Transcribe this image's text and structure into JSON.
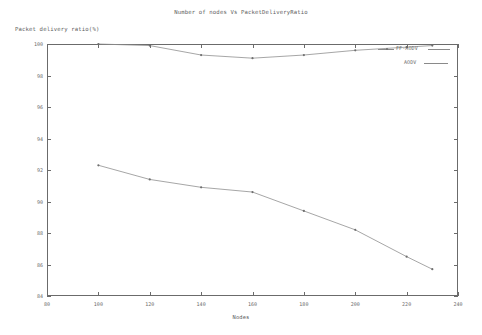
{
  "chart_data": {
    "type": "line",
    "title": "Number of nodes Vs PacketDeliveryRatio",
    "xlabel": "Nodes",
    "ylabel": "Packet delivery ratio(%)",
    "xlim": [
      80,
      240
    ],
    "ylim": [
      84,
      100
    ],
    "xticks": [
      80,
      100,
      120,
      140,
      160,
      180,
      200,
      220,
      240
    ],
    "yticks": [
      84,
      86,
      88,
      90,
      92,
      94,
      96,
      98,
      100
    ],
    "grid": false,
    "legend_position": "upper-right-inside",
    "series": [
      {
        "name": "FF-AODV",
        "x": [
          100,
          120,
          140,
          160,
          180,
          200,
          220,
          230
        ],
        "values": [
          100.0,
          99.9,
          99.3,
          99.1,
          99.3,
          99.6,
          99.8,
          99.9
        ]
      },
      {
        "name": "AODV",
        "x": [
          100,
          120,
          140,
          160,
          180,
          200,
          220,
          230
        ],
        "values": [
          92.3,
          91.4,
          90.9,
          90.6,
          89.4,
          88.2,
          86.5,
          85.7
        ]
      }
    ]
  },
  "legend": {
    "items": [
      {
        "label": "FF-AODV"
      },
      {
        "label": "AODV"
      }
    ]
  },
  "axis": {
    "y_title": "Packet delivery ratio(%)",
    "x_title": "Nodes"
  }
}
